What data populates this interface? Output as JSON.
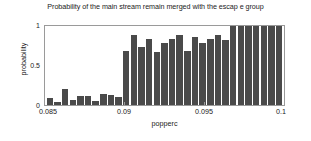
{
  "chart_data": {
    "type": "bar",
    "title": "Probability of the main stream remain merged with the escap e group",
    "xlabel": "popperc",
    "ylabel": "probability",
    "xlim": [
      0.085,
      0.1
    ],
    "ylim": [
      0,
      1
    ],
    "grid": false,
    "legend": null,
    "bar_color": "#4a4a4a",
    "axis_color": "#9a9a9a",
    "background": "#ffffff",
    "xticks": [
      "0.085",
      "0.09",
      "0.095",
      "0.1"
    ],
    "xtick_values": [
      0.085,
      0.09,
      0.095,
      0.1
    ],
    "yticks": [
      "0",
      "0.5",
      "1"
    ],
    "ytick_values": [
      0,
      0.5,
      1
    ],
    "x": [
      0.0852,
      0.0857,
      0.0862,
      0.0867,
      0.0872,
      0.0877,
      0.0882,
      0.0887,
      0.0892,
      0.0897,
      0.0902,
      0.0907,
      0.0912,
      0.0917,
      0.0922,
      0.0927,
      0.0932,
      0.0937,
      0.0942,
      0.0947,
      0.0952,
      0.0957,
      0.0962,
      0.0967,
      0.0972,
      0.0977,
      0.0982,
      0.0987,
      0.0992,
      0.0996,
      0.0999
    ],
    "values": [
      0.09,
      0.04,
      0.2,
      0.06,
      0.11,
      0.11,
      0.05,
      0.14,
      0.13,
      0.1,
      0.68,
      0.89,
      0.74,
      0.84,
      0.67,
      0.78,
      0.84,
      0.88,
      0.69,
      0.86,
      0.79,
      0.83,
      0.88,
      0.82,
      1.0,
      1.0,
      1.0,
      1.0,
      1.0,
      1.0,
      1.0
    ]
  }
}
